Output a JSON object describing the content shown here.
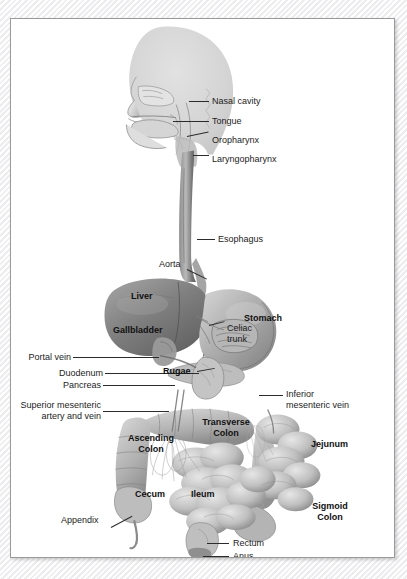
{
  "figure": {
    "style": "grayscale medical illustration",
    "frame_border_color": "#9a9a9a",
    "background_color": "#ffffff"
  },
  "labels": {
    "nasal_cavity": "Nasal cavity",
    "tongue": "Tongue",
    "oropharynx": "Oropharynx",
    "laryngopharynx": "Laryngopharynx",
    "esophagus": "Esophagus",
    "aorta": "Aorta",
    "liver": "Liver",
    "gallbladder": "Gallbladder",
    "stomach": "Stomach",
    "celiac_trunk_line1": "Celiac",
    "celiac_trunk_line2": "trunk",
    "portal_vein": "Portal vein",
    "duodenum": "Duodenum",
    "pancreas": "Pancreas",
    "rugae": "Rugae",
    "superior_mesenteric_line1": "Superior mesenteric",
    "superior_mesenteric_line2": "artery and vein",
    "inferior_mesenteric_line1": "Inferior",
    "inferior_mesenteric_line2": "mesenteric vein",
    "transverse_colon_line1": "Transverse",
    "transverse_colon_line2": "Colon",
    "ascending_colon_line1": "Ascending",
    "ascending_colon_line2": "Colon",
    "jejunum": "Jejunum",
    "cecum": "Cecum",
    "ileum": "Ileum",
    "sigmoid_colon_line1": "Sigmoid",
    "sigmoid_colon_line2": "Colon",
    "appendix": "Appendix",
    "rectum": "Rectum",
    "anus": "Anus"
  },
  "colors": {
    "head_silhouette": "#d2d2d2",
    "organ_light": "#cfcfcf",
    "organ_mid": "#a8a8a8",
    "organ_dark": "#6f6f6f",
    "liver": "#8a8a8a",
    "text": "#1c1c1c",
    "leader_line": "#2b2b2b"
  }
}
